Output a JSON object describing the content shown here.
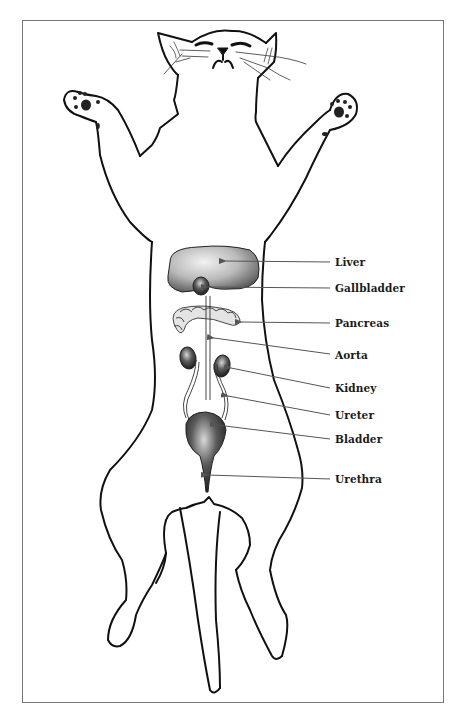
{
  "figure": {
    "colors": {
      "outline": "#111111",
      "leader_line": "#555555",
      "organ_fill": "#cfcfcf",
      "organ_dark": "#3a3a3a",
      "frame": "#777777"
    },
    "labels": [
      {
        "id": "liver",
        "text": "Liver",
        "y": 257,
        "target_x": 224,
        "target_y": 261
      },
      {
        "id": "gallbladder",
        "text": "Gallbladder",
        "y": 283,
        "target_x": 206,
        "target_y": 287
      },
      {
        "id": "pancreas",
        "text": "Pancreas",
        "y": 318,
        "target_x": 240,
        "target_y": 322
      },
      {
        "id": "aorta",
        "text": "Aorta",
        "y": 349,
        "target_x": 212,
        "target_y": 338
      },
      {
        "id": "kidney",
        "text": "Kidney",
        "y": 383,
        "target_x": 229,
        "target_y": 368
      },
      {
        "id": "ureter",
        "text": "Ureter",
        "y": 410,
        "target_x": 226,
        "target_y": 396
      },
      {
        "id": "bladder",
        "text": "Bladder",
        "y": 434,
        "target_x": 215,
        "target_y": 425
      },
      {
        "id": "urethra",
        "text": "Urethra",
        "y": 474,
        "target_x": 206,
        "target_y": 475
      }
    ]
  }
}
